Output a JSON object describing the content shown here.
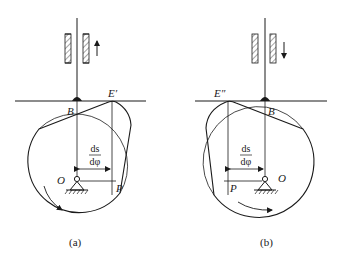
{
  "figure": {
    "panels": [
      {
        "id": "a",
        "caption": "(a)",
        "follower_motion": "up",
        "labels": {
          "contact_point": "B",
          "extreme_point": "E′",
          "pivot": "O",
          "instant_center": "P",
          "dim_numerator": "ds",
          "dim_denominator": "dφ"
        },
        "cam_rotation": "clockwise"
      },
      {
        "id": "b",
        "caption": "(b)",
        "follower_motion": "down",
        "labels": {
          "contact_point": "B",
          "extreme_point": "E″",
          "pivot": "O",
          "instant_center": "P",
          "dim_numerator": "ds",
          "dim_denominator": "dφ"
        },
        "cam_rotation": "counterclockwise"
      }
    ],
    "colors": {
      "line": "#1a1a1a",
      "background": "#ffffff"
    }
  }
}
